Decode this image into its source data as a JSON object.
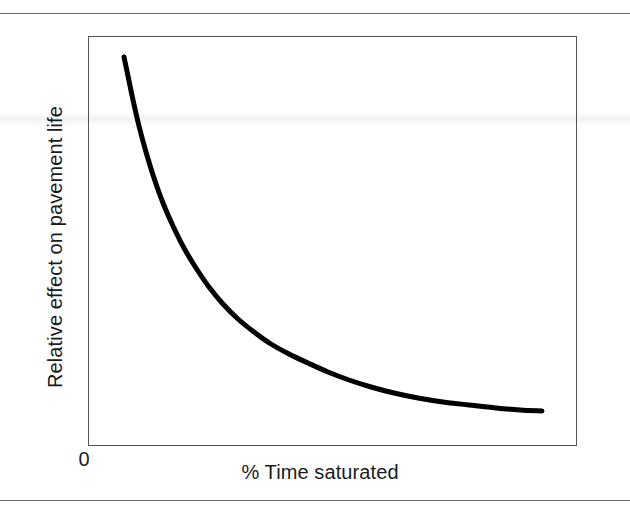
{
  "figure": {
    "background_color": "#ffffff",
    "width": 630,
    "height": 515,
    "rule_color": "#6f6f6f",
    "frame_color": "#555555"
  },
  "axes": {
    "x_label": "% Time saturated",
    "y_label": "Relative effect on pavement life",
    "origin_label": "0"
  },
  "chart_data": {
    "type": "line",
    "title": "",
    "subtitle": "",
    "xlabel": "% Time saturated",
    "ylabel": "Relative effect on pavement life",
    "xlim": [
      0,
      100
    ],
    "ylim": [
      0,
      100
    ],
    "grid": false,
    "legend": null,
    "axis_ticks": {
      "x": [
        "0"
      ],
      "y": []
    },
    "annotations": [],
    "series": [
      {
        "name": "Relative effect on pavement life",
        "color": "#000000",
        "line_width": 5,
        "x": [
          7,
          8,
          9,
          10,
          11,
          12,
          14,
          16,
          18,
          20,
          23,
          26,
          29,
          32,
          36,
          40,
          44,
          48,
          53,
          58,
          63,
          68,
          74,
          80,
          86,
          93
        ],
        "y": [
          95,
          88,
          81,
          75,
          70,
          65,
          57,
          50,
          45,
          40,
          35,
          30,
          27,
          24,
          21,
          18,
          16,
          14,
          12,
          11,
          10,
          9,
          8.5,
          8,
          7.5,
          7
        ]
      }
    ]
  },
  "curve_geometry": {
    "comment": "pixel-space control points of the drawn decay curve",
    "stroke_color": "#000000",
    "stroke_width": 5,
    "points": [
      [
        124,
        57
      ],
      [
        128,
        76
      ],
      [
        133,
        100
      ],
      [
        139,
        126
      ],
      [
        146,
        152
      ],
      [
        154,
        178
      ],
      [
        163,
        203
      ],
      [
        173,
        226
      ],
      [
        184,
        248
      ],
      [
        196,
        268
      ],
      [
        209,
        287
      ],
      [
        223,
        304
      ],
      [
        238,
        319
      ],
      [
        254,
        332
      ],
      [
        271,
        344
      ],
      [
        289,
        354
      ],
      [
        308,
        363
      ],
      [
        328,
        372
      ],
      [
        349,
        380
      ],
      [
        371,
        387
      ],
      [
        394,
        393
      ],
      [
        418,
        398
      ],
      [
        443,
        402
      ],
      [
        469,
        405
      ],
      [
        496,
        408
      ],
      [
        520,
        410
      ],
      [
        542,
        411
      ]
    ]
  }
}
